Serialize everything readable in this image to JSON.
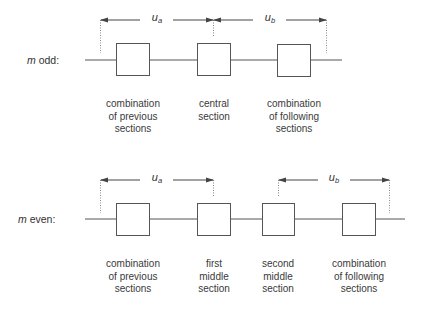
{
  "rows": {
    "odd": {
      "label_var": "m",
      "label_text": " odd:",
      "dimensions": {
        "ua": {
          "symbol": "u",
          "subscript": "a"
        },
        "ub": {
          "symbol": "u",
          "subscript": "b"
        }
      },
      "sections": [
        {
          "caption": "combination\nof previous\nsections"
        },
        {
          "caption": "central\nsection"
        },
        {
          "caption": "combination\nof following\nsections"
        }
      ]
    },
    "even": {
      "label_var": "m",
      "label_text": " even:",
      "dimensions": {
        "ua": {
          "symbol": "u",
          "subscript": "a"
        },
        "ub": {
          "symbol": "u",
          "subscript": "b"
        }
      },
      "sections": [
        {
          "caption": "combination\nof previous\nsections"
        },
        {
          "caption": "first\nmiddle\nsection"
        },
        {
          "caption": "second\nmiddle\nsection"
        },
        {
          "caption": "combination\nof following\nsections"
        }
      ]
    }
  },
  "colors": {
    "line": "#555555",
    "box_stroke": "#555555",
    "dotted": "#888888",
    "text": "#333333"
  }
}
